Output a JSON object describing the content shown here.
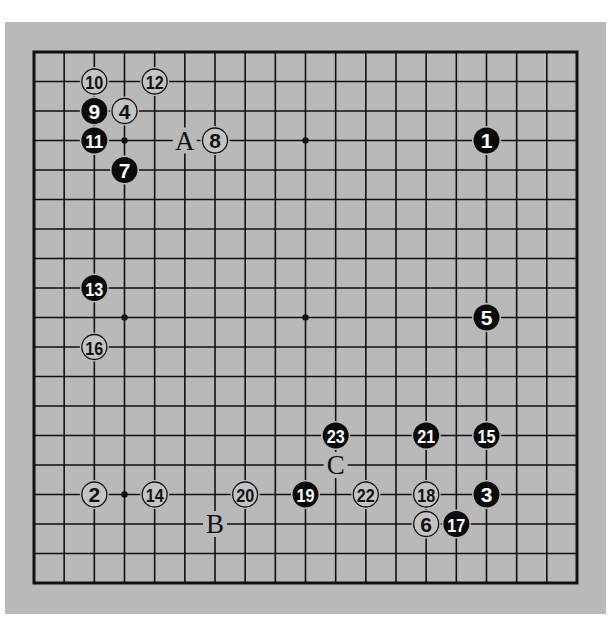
{
  "diagram": {
    "type": "go-board",
    "size": 19,
    "colors": {
      "background": "#ffffff",
      "panel": "#b9b9b9",
      "line": "#111111",
      "black_stone": "#0a0a0a",
      "black_stone_text": "#ffffff",
      "white_stone_fill": "#c4c4c4",
      "white_stone_stroke": "#111111",
      "white_stone_text": "#111111"
    },
    "star_points": [
      [
        3,
        3
      ],
      [
        9,
        3
      ],
      [
        15,
        3
      ],
      [
        3,
        9
      ],
      [
        9,
        9
      ],
      [
        15,
        9
      ],
      [
        3,
        15
      ],
      [
        9,
        15
      ],
      [
        15,
        15
      ]
    ],
    "stones": [
      {
        "move": "1",
        "color": "black",
        "col": 15,
        "row": 3
      },
      {
        "move": "2",
        "color": "white",
        "col": 2,
        "row": 15
      },
      {
        "move": "3",
        "color": "black",
        "col": 15,
        "row": 15
      },
      {
        "move": "4",
        "color": "white",
        "col": 3,
        "row": 2
      },
      {
        "move": "5",
        "color": "black",
        "col": 15,
        "row": 9
      },
      {
        "move": "6",
        "color": "white",
        "col": 13,
        "row": 16
      },
      {
        "move": "7",
        "color": "black",
        "col": 3,
        "row": 4
      },
      {
        "move": "8",
        "color": "white",
        "col": 6,
        "row": 3
      },
      {
        "move": "9",
        "color": "black",
        "col": 2,
        "row": 2
      },
      {
        "move": "10",
        "color": "white",
        "col": 2,
        "row": 1
      },
      {
        "move": "11",
        "color": "black",
        "col": 2,
        "row": 3
      },
      {
        "move": "12",
        "color": "white",
        "col": 4,
        "row": 1
      },
      {
        "move": "13",
        "color": "black",
        "col": 2,
        "row": 8
      },
      {
        "move": "14",
        "color": "white",
        "col": 4,
        "row": 15
      },
      {
        "move": "15",
        "color": "black",
        "col": 15,
        "row": 13
      },
      {
        "move": "16",
        "color": "white",
        "col": 2,
        "row": 10
      },
      {
        "move": "17",
        "color": "black",
        "col": 14,
        "row": 16
      },
      {
        "move": "18",
        "color": "white",
        "col": 13,
        "row": 15
      },
      {
        "move": "19",
        "color": "black",
        "col": 9,
        "row": 15
      },
      {
        "move": "20",
        "color": "white",
        "col": 7,
        "row": 15
      },
      {
        "move": "21",
        "color": "black",
        "col": 13,
        "row": 13
      },
      {
        "move": "22",
        "color": "white",
        "col": 11,
        "row": 15
      },
      {
        "move": "23",
        "color": "black",
        "col": 10,
        "row": 13
      }
    ],
    "labels": [
      {
        "text": "A",
        "col": 5,
        "row": 3
      },
      {
        "text": "B",
        "col": 6,
        "row": 16
      },
      {
        "text": "C",
        "col": 10,
        "row": 14
      }
    ]
  }
}
